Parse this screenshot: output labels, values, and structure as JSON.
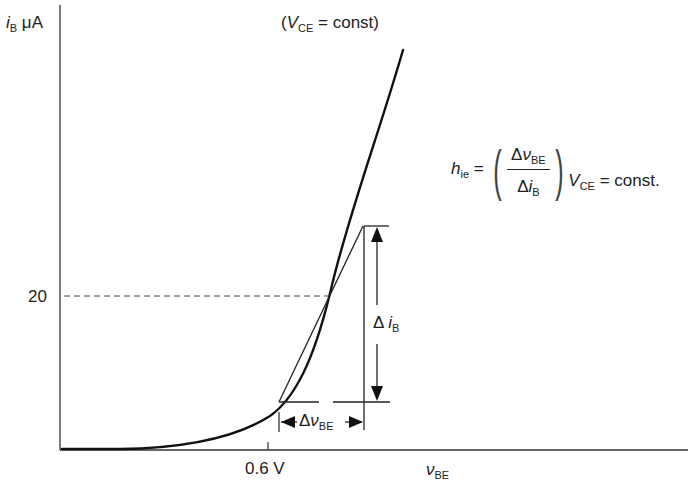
{
  "diagram": {
    "y_axis": {
      "symbol": "i",
      "subscript": "B",
      "unit": "μA"
    },
    "x_axis": {
      "symbol": "ν",
      "subscript": "BE"
    },
    "y_tick": {
      "label": "20"
    },
    "x_tick": {
      "label": "0.6 V"
    },
    "condition": {
      "open": "(",
      "symbol": "V",
      "subscript": "CE",
      "rest": " = const)"
    },
    "delta_ib": {
      "delta": "Δ",
      "symbol": "i",
      "subscript": "B"
    },
    "delta_vbe": {
      "delta": "Δ",
      "symbol": "ν",
      "subscript": "BE"
    },
    "formula": {
      "lhs_symbol": "h",
      "lhs_subscript": "ie",
      "equals": "=",
      "num_delta": "Δ",
      "num_symbol": "ν",
      "num_subscript": "BE",
      "den_delta": "Δ",
      "den_symbol": "i",
      "den_subscript": "B",
      "cond_symbol": "V",
      "cond_subscript": "CE",
      "cond_rest": " = const."
    },
    "colors": {
      "ink": "#1a1a1a",
      "dashed": "#444444",
      "background": "#ffffff"
    }
  }
}
